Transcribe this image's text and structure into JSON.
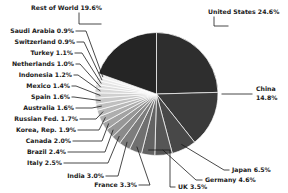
{
  "chart_data": {
    "type": "pie",
    "title": "",
    "legend_position": "callout-labels",
    "label_format": "{name} {value}%",
    "categories": [
      "United States",
      "China",
      "Japan",
      "Germany",
      "UK",
      "France",
      "India",
      "Italy",
      "Brazil",
      "Canada",
      "Korea, Rep.",
      "Russian Fed.",
      "Australia",
      "Spain",
      "Mexico",
      "Indonesia",
      "Netherlands",
      "Turkey",
      "Switzerland",
      "Saudi Arabia",
      "Rest of World"
    ],
    "values": [
      24.6,
      14.8,
      6.5,
      4.6,
      3.5,
      3.3,
      3.0,
      2.5,
      2.4,
      2.0,
      1.9,
      1.7,
      1.6,
      1.6,
      1.4,
      1.2,
      1.0,
      1.1,
      0.9,
      0.9,
      19.6
    ],
    "slices": [
      {
        "name": "United States",
        "value": 24.6,
        "label": "United States 24.6%",
        "color": "#2e2e2e",
        "side": "right"
      },
      {
        "name": "China",
        "value": 14.8,
        "label": "China",
        "label2": "14.8%",
        "color": "#3a3a3a",
        "side": "right"
      },
      {
        "name": "Japan",
        "value": 6.5,
        "label": "Japan 6.5%",
        "color": "#484848",
        "side": "right"
      },
      {
        "name": "Germany",
        "value": 4.6,
        "label": "Germany 4.6%",
        "color": "#565656",
        "side": "right"
      },
      {
        "name": "UK",
        "value": 3.5,
        "label": "UK 3.5%",
        "color": "#636363",
        "side": "bottom"
      },
      {
        "name": "France",
        "value": 3.3,
        "label": "France 3.3%",
        "color": "#707070",
        "side": "bottom"
      },
      {
        "name": "India",
        "value": 3.0,
        "label": "India 3.0%",
        "color": "#7d7d7d",
        "side": "bottom"
      },
      {
        "name": "Italy",
        "value": 2.5,
        "label": "Italy 2.5%",
        "color": "#8a8a8a",
        "side": "left"
      },
      {
        "name": "Brazil",
        "value": 2.4,
        "label": "Brazil 2.4%",
        "color": "#979797",
        "side": "left"
      },
      {
        "name": "Canada",
        "value": 2.0,
        "label": "Canada 2.0%",
        "color": "#a3a3a3",
        "side": "left"
      },
      {
        "name": "Korea, Rep.",
        "value": 1.9,
        "label": "Korea, Rep. 1.9%",
        "color": "#aeaeae",
        "side": "left"
      },
      {
        "name": "Russian Fed.",
        "value": 1.7,
        "label": "Russian Fed. 1.7%",
        "color": "#b8b8b8",
        "side": "left"
      },
      {
        "name": "Australia",
        "value": 1.6,
        "label": "Australia 1.6%",
        "color": "#c0c0c0",
        "side": "left"
      },
      {
        "name": "Spain",
        "value": 1.6,
        "label": "Spain 1.6%",
        "color": "#c8c8c8",
        "side": "left"
      },
      {
        "name": "Mexico",
        "value": 1.4,
        "label": "Mexico 1.4%",
        "color": "#d0d0d0",
        "side": "left"
      },
      {
        "name": "Indonesia",
        "value": 1.2,
        "label": "Indonesia 1.2%",
        "color": "#d7d7d7",
        "side": "left"
      },
      {
        "name": "Netherlands",
        "value": 1.0,
        "label": "Netherlands 1.0%",
        "color": "#dedede",
        "side": "left"
      },
      {
        "name": "Turkey",
        "value": 1.1,
        "label": "Turkey 1.1%",
        "color": "#e4e4e4",
        "side": "left"
      },
      {
        "name": "Switzerland",
        "value": 0.9,
        "label": "Switzerland 0.9%",
        "color": "#eaeaea",
        "side": "left"
      },
      {
        "name": "Saudi Arabia",
        "value": 0.9,
        "label": "Saudi Arabia  0.9%",
        "color": "#f0f0f0",
        "side": "left"
      },
      {
        "name": "Rest of World",
        "value": 19.6,
        "label": "Rest of World 19.6%",
        "color": "#252525",
        "side": "top"
      }
    ],
    "background_color": "#ffffff",
    "label_color": "#1a1a1a",
    "slice_border_color": "#ffffff"
  }
}
